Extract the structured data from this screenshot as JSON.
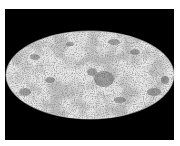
{
  "image": {
    "description": "Full-sky map in Mollweide (elliptical) projection, grayscale, on black background",
    "projection": "mollweide",
    "colors": {
      "background": "#000000",
      "border": "#ffffff",
      "map_light": "#e8e8e8",
      "map_dark": "#505050"
    }
  }
}
